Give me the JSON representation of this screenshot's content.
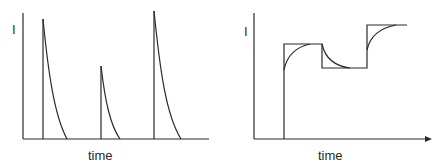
{
  "panels": [
    {
      "id": "left",
      "y_label": "I",
      "x_label": "time",
      "description": "Current spikes that rise instantly then decay to zero",
      "spikes": [
        {
          "x": 43,
          "peak_y": 19,
          "end_x": 67
        },
        {
          "x": 101,
          "peak_y": 66,
          "end_x": 120
        },
        {
          "x": 154,
          "peak_y": 11,
          "end_x": 181
        }
      ]
    },
    {
      "id": "right",
      "y_label": "I",
      "x_label": "time",
      "description": "Stepped input with lagging exponential response curves",
      "steps": [
        {
          "x_start": 284,
          "x_end": 322,
          "level_y": 44
        },
        {
          "x_start": 322,
          "x_end": 367,
          "level_y": 68
        },
        {
          "x_start": 367,
          "x_end": 407,
          "level_y": 25
        }
      ]
    }
  ],
  "colors": {
    "line": "#2a2a2a",
    "background": "#ffffff"
  }
}
